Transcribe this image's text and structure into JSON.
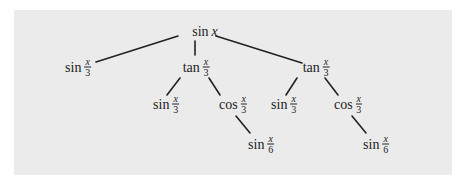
{
  "diagram": {
    "type": "tree",
    "background_color": "#ebebeb",
    "line_color": "#222222",
    "nodes": [
      {
        "id": "root",
        "fn": "sin",
        "arg": "x",
        "x": 205,
        "y": 32
      },
      {
        "id": "l1a",
        "fn": "sin",
        "num": "x",
        "den": "3",
        "x": 78,
        "y": 67,
        "parent": "root"
      },
      {
        "id": "l1b",
        "fn": "tan",
        "num": "x",
        "den": "3",
        "x": 196,
        "y": 67,
        "parent": "root"
      },
      {
        "id": "l1c",
        "fn": "tan",
        "num": "x",
        "den": "3",
        "x": 322,
        "y": 67,
        "parent": "root"
      },
      {
        "id": "l2a",
        "fn": "sin",
        "num": "x",
        "den": "3",
        "x": 166,
        "y": 104,
        "parent": "l1b"
      },
      {
        "id": "l2b",
        "fn": "cos",
        "num": "x",
        "den": "3",
        "x": 246,
        "y": 104,
        "parent": "l1b"
      },
      {
        "id": "l2c",
        "fn": "sin",
        "num": "x",
        "den": "3",
        "x": 290,
        "y": 104,
        "parent": "l1c"
      },
      {
        "id": "l2d",
        "fn": "cos",
        "num": "x",
        "den": "3",
        "x": 353,
        "y": 104,
        "parent": "l1c"
      },
      {
        "id": "l3a",
        "fn": "sin",
        "num": "x",
        "den": "6",
        "x": 275,
        "y": 144,
        "parent": "l2b"
      },
      {
        "id": "l3b",
        "fn": "sin",
        "num": "x",
        "den": "6",
        "x": 384,
        "y": 144,
        "parent": "l2d"
      }
    ]
  }
}
